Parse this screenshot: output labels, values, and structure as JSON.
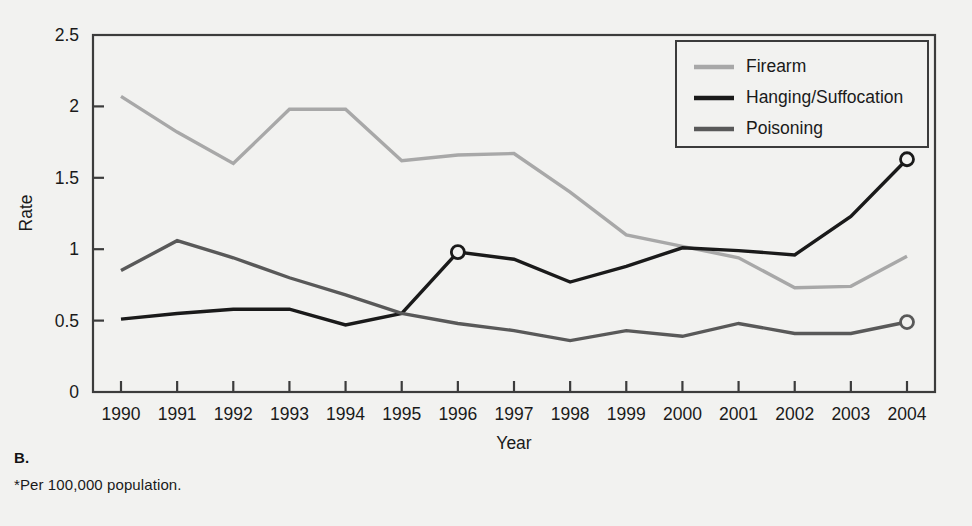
{
  "figure": {
    "panel_letter": "B.",
    "footnote": "*Per 100,000 population.",
    "background_color": "#f2f2f0",
    "frame_color": "#3c3c3c"
  },
  "legend": {
    "position": "top-right",
    "entries": [
      {
        "label": "Firearm",
        "color": "#a8a8a8"
      },
      {
        "label": "Hanging/Suffocation",
        "color": "#1a1a1a"
      },
      {
        "label": "Poisoning",
        "color": "#595959"
      }
    ]
  },
  "axes": {
    "y": {
      "label": "Rate",
      "ticks": [
        "0",
        "0.5",
        "1",
        "1.5",
        "2",
        "2.5"
      ],
      "min": 0,
      "max": 2.5
    },
    "x": {
      "label": "Year",
      "ticks": [
        "1990",
        "1991",
        "1992",
        "1993",
        "1994",
        "1995",
        "1996",
        "1997",
        "1998",
        "1999",
        "2000",
        "2001",
        "2002",
        "2003",
        "2004"
      ]
    }
  },
  "chart_data": {
    "type": "line",
    "title": "",
    "xlabel": "Year",
    "ylabel": "Rate",
    "xlim": [
      1990,
      2004
    ],
    "ylim": [
      0,
      2.5
    ],
    "grid": false,
    "legend_position": "top-right",
    "categories": [
      1990,
      1991,
      1992,
      1993,
      1994,
      1995,
      1996,
      1997,
      1998,
      1999,
      2000,
      2001,
      2002,
      2003,
      2004
    ],
    "series": [
      {
        "name": "Firearm",
        "color": "#a8a8a8",
        "values": [
          2.07,
          1.82,
          1.6,
          1.98,
          1.98,
          1.62,
          1.66,
          1.67,
          1.4,
          1.1,
          1.02,
          0.94,
          0.73,
          0.74,
          0.95
        ],
        "markers": []
      },
      {
        "name": "Hanging/Suffocation",
        "color": "#1a1a1a",
        "values": [
          0.51,
          0.55,
          0.58,
          0.58,
          0.47,
          0.55,
          0.98,
          0.93,
          0.77,
          0.88,
          1.01,
          0.99,
          0.96,
          1.23,
          1.63
        ],
        "markers": [
          1996,
          2004
        ]
      },
      {
        "name": "Poisoning",
        "color": "#595959",
        "values": [
          0.85,
          1.06,
          0.94,
          0.8,
          0.68,
          0.55,
          0.48,
          0.43,
          0.36,
          0.43,
          0.39,
          0.48,
          0.41,
          0.41,
          0.49
        ],
        "markers": [
          2004
        ]
      }
    ]
  }
}
